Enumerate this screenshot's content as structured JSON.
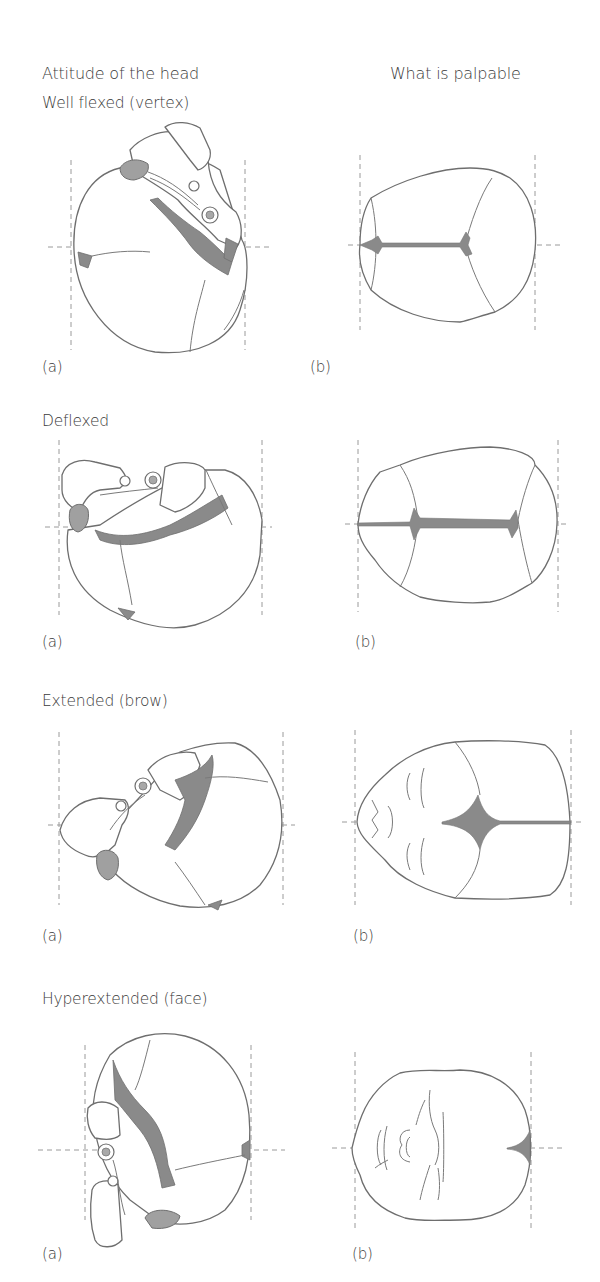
{
  "headers": {
    "left": "Attitude of the head",
    "right": "What is palpable"
  },
  "sections": [
    {
      "title": "Well flexed (vertex)",
      "label_a": "(a)",
      "label_b": "(b)",
      "left_figure": "lateral-skull-well-flexed",
      "right_figure": "vertex-view-posterior-and-anterior-fontanelles"
    },
    {
      "title": "Deflexed",
      "label_a": "(a)",
      "label_b": "(b)",
      "left_figure": "lateral-skull-deflexed",
      "right_figure": "vertex-view-both-fontanelles-centered"
    },
    {
      "title": "Extended (brow)",
      "label_a": "(a)",
      "label_b": "(b)",
      "left_figure": "lateral-skull-extended",
      "right_figure": "brow-view-anterior-fontanelle-and-orbits"
    },
    {
      "title": "Hyperextended (face)",
      "label_a": "(a)",
      "label_b": "(b)",
      "left_figure": "lateral-skull-hyperextended",
      "right_figure": "face-view-mouth-nose-chin"
    }
  ],
  "colors": {
    "line": "#6e6e6e",
    "fontanelle_fill": "#8a8a8a",
    "guide": "#9a9a9a",
    "text": "#3a3a3a"
  }
}
